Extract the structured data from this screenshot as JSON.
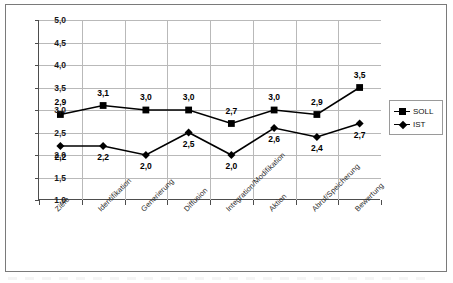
{
  "chart_data": {
    "type": "line",
    "title": "",
    "xlabel": "",
    "ylabel": "",
    "ylim": [
      1.0,
      5.0
    ],
    "ytick_step": 0.5,
    "grid": true,
    "legend_position": "right",
    "categories": [
      "Ziele",
      "Identifikation",
      "Generierung",
      "Diffusion",
      "Integration/Modifikation",
      "Aktion",
      "Abruf/Speicherung",
      "Bewertung"
    ],
    "ytick_labels": [
      "5,0",
      "4,5",
      "4,0",
      "3,5",
      "3,0",
      "2,5",
      "2,0",
      "1,5",
      "1,0"
    ],
    "ytick_values": [
      5.0,
      4.5,
      4.0,
      3.5,
      3.0,
      2.5,
      2.0,
      1.5,
      1.0
    ],
    "series": [
      {
        "name": "SOLL",
        "marker": "square",
        "color": "#000000",
        "label_position": "above",
        "values": [
          2.9,
          3.1,
          3.0,
          3.0,
          2.7,
          3.0,
          2.9,
          3.5
        ],
        "value_labels": [
          "2,9",
          "3,1",
          "3,0",
          "3,0",
          "2,7",
          "3,0",
          "2,9",
          "3,5"
        ]
      },
      {
        "name": "IST",
        "marker": "diamond",
        "color": "#000000",
        "label_position": "below",
        "values": [
          2.2,
          2.2,
          2.0,
          2.5,
          2.0,
          2.6,
          2.4,
          2.7
        ],
        "value_labels": [
          "2,2",
          "2,2",
          "2,0",
          "2,5",
          "2,0",
          "2,6",
          "2,4",
          "2,7"
        ]
      }
    ]
  },
  "legend": {
    "entries": [
      {
        "label": "SOLL",
        "marker": "square-marker"
      },
      {
        "label": "IST",
        "marker": "diamond-marker"
      }
    ]
  }
}
